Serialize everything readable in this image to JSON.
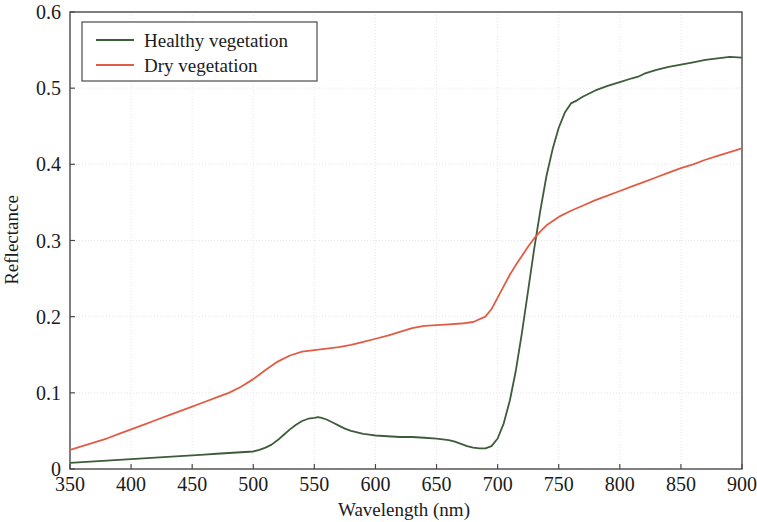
{
  "chart_data": {
    "type": "line",
    "title": "",
    "xlabel": "Wavelength (nm)",
    "ylabel": "Reflectance",
    "xlim": [
      350,
      900
    ],
    "ylim": [
      0,
      0.6
    ],
    "xticks": [
      350,
      400,
      450,
      500,
      550,
      600,
      650,
      700,
      750,
      800,
      850,
      900
    ],
    "yticks": [
      0,
      0.1,
      0.2,
      0.3,
      0.4,
      0.5,
      0.6
    ],
    "xtick_labels": [
      "350",
      "400",
      "450",
      "500",
      "550",
      "600",
      "650",
      "700",
      "750",
      "800",
      "850",
      "900"
    ],
    "ytick_labels": [
      "0",
      "0.1",
      "0.2",
      "0.3",
      "0.4",
      "0.5",
      "0.6"
    ],
    "grid": true,
    "legend_position": "upper left",
    "series": [
      {
        "name": "Healthy vegetation",
        "color": "#3d5c3a",
        "x": [
          350,
          360,
          370,
          380,
          390,
          400,
          410,
          420,
          430,
          440,
          450,
          460,
          470,
          480,
          490,
          500,
          505,
          510,
          515,
          520,
          525,
          530,
          535,
          540,
          545,
          550,
          553,
          556,
          560,
          565,
          570,
          575,
          580,
          585,
          590,
          595,
          600,
          610,
          620,
          630,
          640,
          650,
          660,
          665,
          670,
          675,
          680,
          685,
          690,
          695,
          700,
          705,
          710,
          715,
          720,
          725,
          730,
          735,
          740,
          745,
          750,
          755,
          760,
          765,
          770,
          780,
          790,
          800,
          810,
          815,
          820,
          830,
          840,
          850,
          860,
          870,
          880,
          890,
          900
        ],
        "y": [
          0.008,
          0.009,
          0.01,
          0.011,
          0.012,
          0.013,
          0.014,
          0.015,
          0.016,
          0.017,
          0.018,
          0.019,
          0.02,
          0.021,
          0.022,
          0.023,
          0.025,
          0.028,
          0.032,
          0.038,
          0.045,
          0.052,
          0.058,
          0.063,
          0.066,
          0.067,
          0.068,
          0.067,
          0.065,
          0.061,
          0.057,
          0.053,
          0.05,
          0.048,
          0.046,
          0.045,
          0.044,
          0.043,
          0.042,
          0.042,
          0.041,
          0.04,
          0.038,
          0.036,
          0.033,
          0.03,
          0.028,
          0.027,
          0.027,
          0.03,
          0.04,
          0.06,
          0.09,
          0.13,
          0.18,
          0.235,
          0.29,
          0.34,
          0.385,
          0.42,
          0.448,
          0.468,
          0.48,
          0.484,
          0.489,
          0.497,
          0.503,
          0.508,
          0.513,
          0.515,
          0.519,
          0.524,
          0.528,
          0.531,
          0.534,
          0.537,
          0.539,
          0.541,
          0.54
        ]
      },
      {
        "name": "Dry vegetation",
        "color": "#e15c45",
        "x": [
          350,
          360,
          370,
          380,
          390,
          400,
          410,
          420,
          430,
          440,
          450,
          460,
          470,
          480,
          490,
          500,
          510,
          520,
          530,
          540,
          550,
          560,
          570,
          580,
          590,
          600,
          610,
          620,
          630,
          640,
          650,
          660,
          670,
          680,
          690,
          695,
          700,
          705,
          710,
          715,
          720,
          725,
          730,
          735,
          740,
          750,
          760,
          770,
          780,
          790,
          800,
          810,
          820,
          830,
          840,
          850,
          860,
          870,
          880,
          890,
          900
        ],
        "y": [
          0.025,
          0.03,
          0.035,
          0.04,
          0.046,
          0.052,
          0.058,
          0.064,
          0.07,
          0.076,
          0.082,
          0.088,
          0.094,
          0.1,
          0.108,
          0.118,
          0.13,
          0.141,
          0.149,
          0.154,
          0.156,
          0.158,
          0.16,
          0.163,
          0.167,
          0.171,
          0.175,
          0.18,
          0.185,
          0.188,
          0.189,
          0.19,
          0.191,
          0.193,
          0.2,
          0.21,
          0.225,
          0.24,
          0.255,
          0.268,
          0.28,
          0.292,
          0.303,
          0.312,
          0.32,
          0.331,
          0.339,
          0.346,
          0.353,
          0.359,
          0.365,
          0.371,
          0.377,
          0.383,
          0.389,
          0.395,
          0.4,
          0.406,
          0.411,
          0.416,
          0.421
        ]
      }
    ]
  },
  "legend": {
    "items": [
      {
        "label": "Healthy vegetation",
        "color": "#3d5c3a"
      },
      {
        "label": "Dry vegetation",
        "color": "#e15c45"
      }
    ]
  },
  "axes": {
    "x_title": "Wavelength (nm)",
    "y_title": "Reflectance"
  }
}
